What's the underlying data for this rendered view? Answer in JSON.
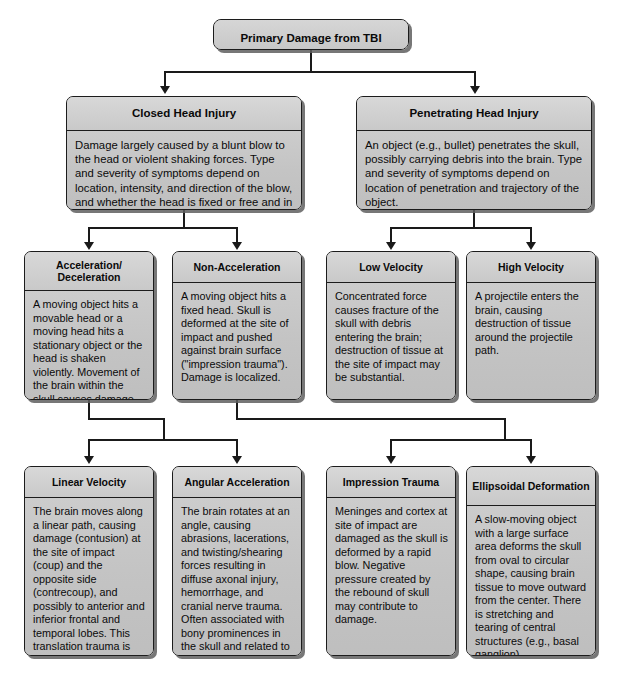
{
  "diagram": {
    "title": "Primary Damage from TBI",
    "nodes": {
      "root": {
        "label": "Primary Damage from TBI"
      },
      "closed_head_injury": {
        "label": "Closed Head Injury",
        "body": "Damage largely caused by a blunt blow to the head or violent shaking forces. Type and severity of symptoms depend on location, intensity, and direction of the blow, and whether the head is fixed or free and in rotational or linear motion."
      },
      "penetrating_head_injury": {
        "label": "Penetrating Head Injury",
        "body": "An object (e.g., bullet) penetrates the skull, possibly carrying debris into the brain. Type and severity of symptoms depend on location of penetration and trajectory of the object."
      },
      "acceleration_deceleration": {
        "label": "Acceleration/ Deceleration",
        "body": "A moving object hits a movable head or a moving head hits a stationary object or the head is shaken violently. Movement of the brain within the skull causes damage."
      },
      "non_acceleration": {
        "label": "Non-Acceleration",
        "body": "A moving object hits a fixed head. Skull is deformed at the site of impact and pushed against brain surface (\"impression trauma\"). Damage is localized."
      },
      "low_velocity": {
        "label": "Low Velocity",
        "body": "Concentrated force causes fracture of the skull with debris entering the brain; destruction of tissue at the site of impact may be substantial."
      },
      "high_velocity": {
        "label": "High Velocity",
        "body": "A projectile enters the brain, causing destruction of tissue around the projectile path."
      },
      "linear_velocity": {
        "label": "Linear Velocity",
        "body": "The brain moves along a linear path, causing damage (contusion) at the site of impact (coup) and the opposite side (contrecoup), and possibly to anterior and inferior frontal and temporal lobes. This translation trauma is often due to blows in the front or back of the head."
      },
      "angular_acceleration": {
        "label": "Angular Acceleration",
        "body": "The brain rotates at an angle, causing abrasions, lacerations, and twisting/shearing forces resulting in diffuse axonal injury, hemorrhage, and cranial nerve trauma. Often associated with bony prominences in the skull and related to frontolimbic injury."
      },
      "impression_trauma": {
        "label": "Impression Trauma",
        "body": "Meninges and cortex at site of impact are damaged as the skull is deformed by a rapid blow. Negative pressure created by the rebound of skull may contribute to damage."
      },
      "ellipsoidal_deformation": {
        "label": "Ellipsoidal Deformation",
        "body": "A slow-moving object with a large surface area deforms the skull from oval to circular shape, causing brain tissue to move outward from the center. There is stretching and tearing of central structures (e.g., basal ganglion)."
      }
    },
    "edges": [
      {
        "from": "root",
        "to": "closed_head_injury"
      },
      {
        "from": "root",
        "to": "penetrating_head_injury"
      },
      {
        "from": "closed_head_injury",
        "to": "acceleration_deceleration"
      },
      {
        "from": "closed_head_injury",
        "to": "non_acceleration"
      },
      {
        "from": "penetrating_head_injury",
        "to": "low_velocity"
      },
      {
        "from": "penetrating_head_injury",
        "to": "high_velocity"
      },
      {
        "from": "acceleration_deceleration",
        "to": "linear_velocity"
      },
      {
        "from": "acceleration_deceleration",
        "to": "angular_acceleration"
      },
      {
        "from": "non_acceleration",
        "to": "impression_trauma"
      },
      {
        "from": "non_acceleration",
        "to": "ellipsoidal_deformation"
      }
    ],
    "colors": {
      "box_fill": "#c8c8c8",
      "box_border": "#1c1c1c",
      "connector": "#1a1a1a",
      "shadow": "#5f5f5f",
      "background": "#ffffff",
      "text": "#0a0a0a"
    }
  }
}
